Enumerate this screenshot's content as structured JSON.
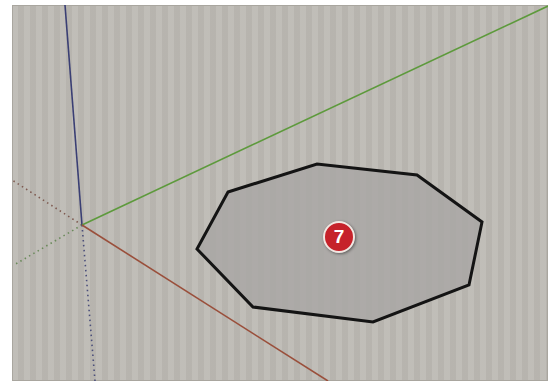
{
  "viewport": {
    "background_color": "#bdbab4",
    "axes": {
      "origin": [
        82,
        225
      ],
      "blue_solid": {
        "color": "#3a3f74",
        "from": [
          65,
          5
        ],
        "to": [
          82,
          225
        ]
      },
      "blue_dotted": {
        "color": "#4a4e7a",
        "from": [
          82,
          225
        ],
        "to": [
          95,
          381
        ]
      },
      "green_solid": {
        "color": "#5d9a3c",
        "from": [
          82,
          225
        ],
        "to": [
          548,
          6
        ]
      },
      "green_dotted": {
        "color": "#6a8a5a",
        "from": [
          82,
          225
        ],
        "to": [
          14,
          265
        ]
      },
      "red_solid": {
        "color": "#9a4f3b",
        "from": [
          82,
          225
        ],
        "to": [
          328,
          381
        ]
      },
      "red_dotted": {
        "color": "#7e5a50",
        "from": [
          82,
          225
        ],
        "to": [
          12,
          180
        ]
      }
    },
    "shape": {
      "type": "polygon",
      "sides": 10,
      "fill": "#a9a7a4",
      "stroke": "#141414",
      "vertices": [
        [
          228,
          192
        ],
        [
          317,
          164
        ],
        [
          417,
          175
        ],
        [
          482,
          222
        ],
        [
          469,
          285
        ],
        [
          373,
          322
        ],
        [
          253,
          307
        ],
        [
          197,
          249
        ]
      ]
    },
    "step_badge": {
      "label": "7",
      "center": [
        339,
        237
      ],
      "color": "#c6222a"
    }
  }
}
